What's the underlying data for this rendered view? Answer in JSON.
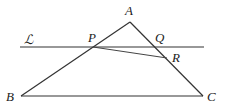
{
  "diagram": {
    "type": "geometry",
    "colors": {
      "stroke": "#333333",
      "label": "#222222",
      "background": "#ffffff"
    },
    "points": {
      "A": {
        "label": "A",
        "x": 130,
        "y": 22
      },
      "B": {
        "label": "B",
        "x": 21,
        "y": 96
      },
      "C": {
        "label": "C",
        "x": 203,
        "y": 96
      },
      "P": {
        "label": "P",
        "x": 93,
        "y": 47
      },
      "Q": {
        "label": "Q",
        "x": 155,
        "y": 47
      },
      "R": {
        "label": "R",
        "x": 167,
        "y": 58
      }
    },
    "line_L": {
      "label": "ℒ",
      "x1": 20,
      "y1": 47,
      "x2": 204,
      "y2": 47
    },
    "segments": [
      {
        "name": "AB",
        "from": "A",
        "to": "B"
      },
      {
        "name": "AC",
        "from": "A",
        "to": "C"
      },
      {
        "name": "BC",
        "from": "B",
        "to": "C"
      },
      {
        "name": "PR",
        "from": "P",
        "to": "R"
      }
    ],
    "labels": {
      "A": {
        "text": "A",
        "x": 125,
        "y": 15
      },
      "B": {
        "text": "B",
        "x": 6,
        "y": 101
      },
      "C": {
        "text": "C",
        "x": 207,
        "y": 101
      },
      "P": {
        "text": "P",
        "x": 88,
        "y": 42
      },
      "Q": {
        "text": "Q",
        "x": 155,
        "y": 42
      },
      "R": {
        "text": "R",
        "x": 172,
        "y": 62
      },
      "L": {
        "text": "ℒ",
        "x": 24,
        "y": 44
      }
    }
  }
}
